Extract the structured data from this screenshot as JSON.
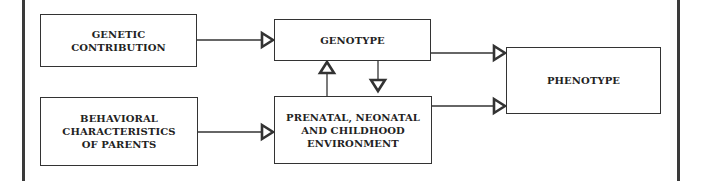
{
  "diagram": {
    "nodes": [
      {
        "id": "genetic",
        "label": "GENETIC\nCONTRIBUTION"
      },
      {
        "id": "behavioral",
        "label": "BEHAVIORAL\nCHARACTERISTICS\nOF PARENTS"
      },
      {
        "id": "genotype",
        "label": "GENOTYPE"
      },
      {
        "id": "environment",
        "label": "PRENATAL, NEONATAL\nAND CHILDHOOD\nENVIRONMENT"
      },
      {
        "id": "phenotype",
        "label": "PHENOTYPE"
      }
    ],
    "edges": [
      {
        "from": "genetic",
        "to": "genotype"
      },
      {
        "from": "behavioral",
        "to": "environment"
      },
      {
        "from": "environment",
        "to": "genotype"
      },
      {
        "from": "genotype",
        "to": "environment"
      },
      {
        "from": "genotype",
        "to": "phenotype"
      },
      {
        "from": "environment",
        "to": "phenotype"
      }
    ],
    "colors": {
      "line": "#333333",
      "background": "#ffffff"
    }
  }
}
